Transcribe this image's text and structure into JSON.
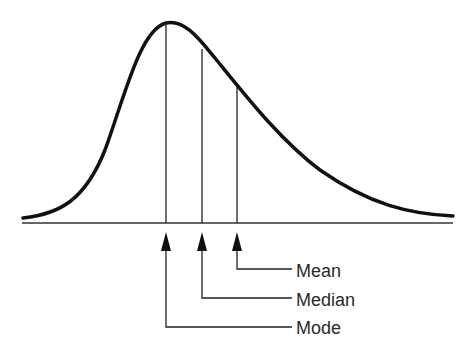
{
  "diagram": {
    "curve": {
      "type": "right-skewed-density",
      "stroke_color": "#111111",
      "stroke_width": 3.5,
      "path_points": [
        [
          23,
          218
        ],
        [
          166,
          23
        ],
        [
          453,
          216
        ]
      ]
    },
    "axis": {
      "x_start": 22,
      "x_end": 453,
      "y": 223,
      "color": "#333333"
    },
    "markers": [
      {
        "name": "Mode",
        "label": "Mode",
        "x": 166,
        "curve_y": 23,
        "label_y": 334
      },
      {
        "name": "Median",
        "label": "Median",
        "x": 202,
        "curve_y": 49,
        "label_y": 306
      },
      {
        "name": "Mean",
        "label": "Mean",
        "x": 237,
        "curve_y": 87,
        "label_y": 277
      }
    ],
    "leader_end_x": 292,
    "label_x": 296
  }
}
